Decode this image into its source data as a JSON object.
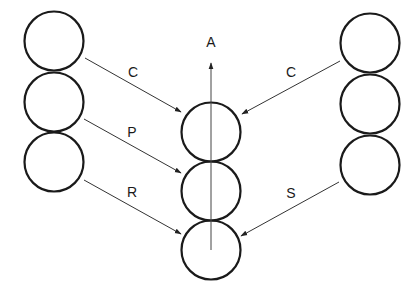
{
  "diagram": {
    "axis_label": "A",
    "left_column": {
      "circles": [
        {
          "cx": 54,
          "cy": 41,
          "r": 29.5
        },
        {
          "cx": 54,
          "cy": 102,
          "r": 29.5
        },
        {
          "cx": 54,
          "cy": 162,
          "r": 29.5
        }
      ]
    },
    "center_column": {
      "circles": [
        {
          "cx": 211,
          "cy": 132,
          "r": 29.5
        },
        {
          "cx": 211,
          "cy": 191,
          "r": 29.5
        },
        {
          "cx": 211,
          "cy": 250,
          "r": 29.5
        }
      ]
    },
    "right_column": {
      "circles": [
        {
          "cx": 370,
          "cy": 43,
          "r": 29.5
        },
        {
          "cx": 370,
          "cy": 104,
          "r": 29.5
        },
        {
          "cx": 370,
          "cy": 165,
          "r": 29.5
        }
      ]
    },
    "arrows": [
      {
        "label": "C",
        "from": "left-1",
        "to": "center-1"
      },
      {
        "label": "P",
        "from": "left-2",
        "to": "center-2"
      },
      {
        "label": "R",
        "from": "left-3",
        "to": "center-3"
      },
      {
        "label": "C",
        "from": "right-1",
        "to": "center-1"
      },
      {
        "label": "S",
        "from": "right-3",
        "to": "center-3"
      }
    ]
  }
}
